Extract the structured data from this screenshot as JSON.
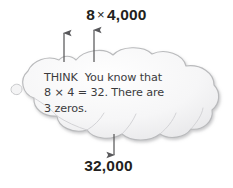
{
  "diagram": {
    "kind": "thought-bubble-math-strategy",
    "background_color": "#ffffff",
    "text_color": "#231f20",
    "cloud_fill": "#f7f7f8",
    "cloud_stroke": "#b9babc",
    "arrow_color": "#58585b"
  },
  "top_expression": {
    "factor_left": "8",
    "operator": "×",
    "factor_right": "4,000",
    "full": "8 × 4,000"
  },
  "arrows": {
    "up_left_label": "arrow-up-to-8",
    "up_right_label": "arrow-up-to-4000",
    "down_label": "arrow-down-to-product",
    "count_up": 2,
    "count_down": 1
  },
  "cloud": {
    "lead_word": "THINK",
    "lines": [
      "THINK  You know that",
      "8 × 4 = 32. There are",
      "3 zeros."
    ],
    "line1_rest": "You know that",
    "line2": "8 × 4 = 32. There are",
    "line3": "3 zeros."
  },
  "bottom_expression": {
    "product": "32,000"
  }
}
